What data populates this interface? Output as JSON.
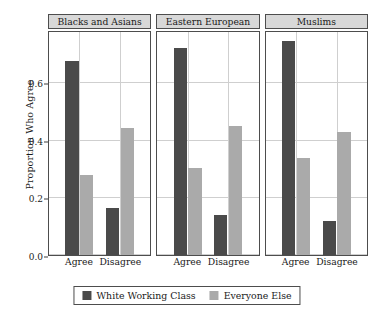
{
  "chart_data": {
    "type": "bar",
    "title": "",
    "xlabel": "",
    "ylabel": "Proportion Who Agree",
    "ylim": [
      0,
      0.78
    ],
    "yticks": [
      0.0,
      0.2,
      0.4,
      0.6
    ],
    "ytick_labels": [
      "0.0",
      "0.2",
      "0.4",
      "0.6"
    ],
    "grid": true,
    "grid_axis": "both",
    "legend_position": "bottom",
    "categories": [
      "Agree",
      "Disagree"
    ],
    "panels": [
      "Blacks and Asians",
      "Eastern European",
      "Muslims"
    ],
    "series": [
      {
        "name": "White Working Class",
        "color": "#4a4a4a",
        "values_by_panel": {
          "Blacks and Asians": [
            0.68,
            0.165
          ],
          "Eastern European": [
            0.725,
            0.14
          ],
          "Muslims": [
            0.75,
            0.12
          ]
        }
      },
      {
        "name": "Everyone Else",
        "color": "#aaaaaa",
        "values_by_panel": {
          "Blacks and Asians": [
            0.28,
            0.445
          ],
          "Eastern European": [
            0.305,
            0.45
          ],
          "Muslims": [
            0.34,
            0.43
          ]
        }
      }
    ]
  },
  "axes": {
    "y_title": "Proportion Who Agree",
    "tick_labels": [
      "0.6",
      "0.4",
      "0.2",
      "0.0"
    ]
  },
  "panels": [
    {
      "title": "Blacks and Asians",
      "x_labels": [
        "Agree",
        "Disagree"
      ]
    },
    {
      "title": "Eastern European",
      "x_labels": [
        "Agree",
        "Disagree"
      ]
    },
    {
      "title": "Muslims",
      "x_labels": [
        "Agree",
        "Disagree"
      ]
    }
  ],
  "legend": {
    "items": [
      {
        "label": "White Working Class",
        "color": "#4a4a4a"
      },
      {
        "label": "Everyone Else",
        "color": "#aaaaaa"
      }
    ]
  },
  "colors": {
    "dark_bar": "#4a4a4a",
    "light_bar": "#aaaaaa",
    "strip_background": "#d8d8d8",
    "border": "#4d4d4d",
    "gridline": "#cfcfcf",
    "background": "#ffffff"
  }
}
